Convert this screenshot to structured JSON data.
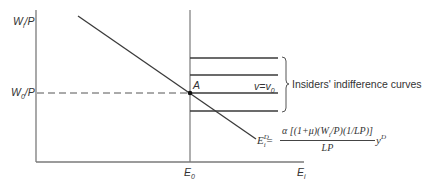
{
  "diagram": {
    "y_axis_label": {
      "main": "W",
      "sub": "i",
      "tail": "/P"
    },
    "y_tick_label": {
      "main": "W",
      "sub": "0",
      "tail": "/P"
    },
    "x_axis_label": {
      "main": "E",
      "sub": "i"
    },
    "x_tick_label": {
      "main": "E",
      "sub": "0"
    },
    "point_label": "A",
    "curve_label": {
      "main": "v",
      "eq": "=",
      "rhs": "v",
      "rhs_sub": "0"
    },
    "brace_label": "Insiders' indifference curves",
    "demand_equation": {
      "lhs": "E",
      "lhs_sup": "D",
      "lhs_sub": "i",
      "eq": "=",
      "numerator": "α [(1+μ)(W/P)(1/LP)]",
      "numerator_parts": {
        "alpha": "α",
        "open": " [(1+μ)(W",
        "w_sub": "i",
        "close": "/P)(1/LP)]"
      },
      "denominator": "LP",
      "tail": "y",
      "tail_sup": "D"
    },
    "colors": {
      "line": "#3a3a3a",
      "axis": "#7a7a7a",
      "dashed": "#555555"
    }
  }
}
